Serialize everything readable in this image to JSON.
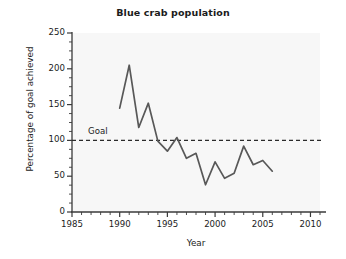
{
  "chart_data": {
    "type": "line",
    "title": "Blue crab population",
    "xlabel": "Year",
    "ylabel": "Percentage of goal achieved",
    "xlim": [
      1985,
      2011
    ],
    "ylim": [
      0,
      250
    ],
    "grid": false,
    "legend": null,
    "x_ticks": [
      1985,
      1990,
      1995,
      2000,
      2005,
      2010
    ],
    "x_tick_labels": [
      "1985",
      "1990",
      "1995",
      "2000",
      "2005",
      "2010"
    ],
    "x_minor_step": 1,
    "y_ticks": [
      0,
      50,
      100,
      150,
      200,
      250
    ],
    "y_tick_labels": [
      "0",
      "50",
      "100",
      "150",
      "200",
      "250"
    ],
    "y_minor_step": 12.5,
    "series": [
      {
        "name": "Blue crab population",
        "color": "#585858",
        "x": [
          1990,
          1991,
          1992,
          1993,
          1994,
          1995,
          1996,
          1997,
          1998,
          1999,
          2000,
          2001,
          2002,
          2003,
          2004,
          2005,
          2006
        ],
        "values": [
          145,
          205,
          118,
          152,
          99,
          85,
          104,
          75,
          82,
          38,
          70,
          47,
          54,
          92,
          66,
          72,
          57
        ]
      }
    ],
    "annotations": [
      {
        "type": "hline",
        "label": "Goal",
        "value": 100,
        "style": "dashed",
        "color": "#2b2b2b"
      }
    ]
  },
  "style": {
    "plot_background": "#f7f7f7",
    "page_background": "#ffffff",
    "axis_color": "#3a3a3a",
    "text_color": "#1b1b1b"
  }
}
